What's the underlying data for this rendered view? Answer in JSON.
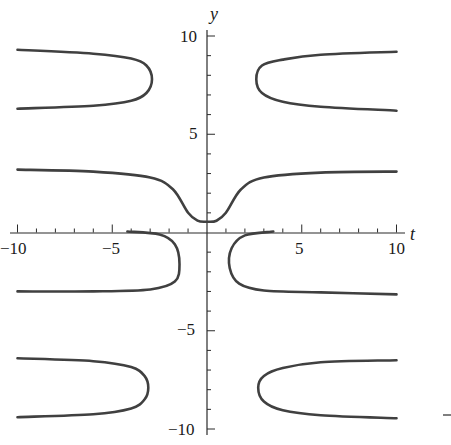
{
  "chart_data": {
    "type": "line",
    "title": "",
    "xlabel": "t",
    "ylabel": "y",
    "xlim": [
      -10,
      10
    ],
    "ylim": [
      -10,
      10
    ],
    "grid": false,
    "legend": null,
    "x_ticks_major": [
      -10,
      -5,
      5,
      10
    ],
    "x_tick_labels": [
      "−10",
      "−5",
      "5",
      "10"
    ],
    "x_ticks_minor_step": 1,
    "y_ticks_major": [
      -10,
      -5,
      5,
      10
    ],
    "y_tick_labels": [
      "−10",
      "−5",
      "5",
      "10"
    ],
    "y_ticks_minor_step": 1,
    "axes_style": "crossing at origin",
    "series": [
      {
        "name": "upper-left branch",
        "points": [
          [
            -10,
            9.3
          ],
          [
            -6,
            9.1
          ],
          [
            -4,
            8.85
          ],
          [
            -3.2,
            8.5
          ],
          [
            -2.9,
            7.8
          ],
          [
            -3.2,
            7.1
          ],
          [
            -4,
            6.7
          ],
          [
            -6,
            6.45
          ],
          [
            -10,
            6.3
          ]
        ]
      },
      {
        "name": "upper-right branch",
        "points": [
          [
            10,
            9.2
          ],
          [
            6,
            9.05
          ],
          [
            4,
            8.8
          ],
          [
            2.9,
            8.5
          ],
          [
            2.6,
            7.8
          ],
          [
            2.9,
            7.1
          ],
          [
            4,
            6.65
          ],
          [
            6,
            6.4
          ],
          [
            10,
            6.2
          ]
        ]
      },
      {
        "name": "central U branch",
        "points": [
          [
            -10,
            3.2
          ],
          [
            -6,
            3.1
          ],
          [
            -3,
            2.8
          ],
          [
            -1.8,
            2.2
          ],
          [
            -1.0,
            1.0
          ],
          [
            -0.5,
            0.6
          ],
          [
            0,
            0.55
          ],
          [
            0.5,
            0.6
          ],
          [
            1.0,
            1.0
          ],
          [
            1.8,
            2.2
          ],
          [
            3,
            2.8
          ],
          [
            6,
            3.05
          ],
          [
            10,
            3.1
          ]
        ]
      },
      {
        "name": "lower-left branch",
        "points": [
          [
            -4.2,
            0.05
          ],
          [
            -2.5,
            -0.1
          ],
          [
            -1.7,
            -0.6
          ],
          [
            -1.45,
            -1.6
          ],
          [
            -1.7,
            -2.5
          ],
          [
            -3,
            -2.9
          ],
          [
            -6,
            -3.0
          ],
          [
            -10,
            -3.0
          ]
        ]
      },
      {
        "name": "lower-right branch",
        "points": [
          [
            3.5,
            0.05
          ],
          [
            2,
            -0.15
          ],
          [
            1.3,
            -0.8
          ],
          [
            1.2,
            -1.8
          ],
          [
            1.7,
            -2.6
          ],
          [
            3,
            -2.95
          ],
          [
            6,
            -3.05
          ],
          [
            10,
            -3.15
          ]
        ]
      },
      {
        "name": "bottom-left branch",
        "points": [
          [
            -10,
            -6.4
          ],
          [
            -6,
            -6.55
          ],
          [
            -4,
            -6.85
          ],
          [
            -3.3,
            -7.3
          ],
          [
            -3.1,
            -7.9
          ],
          [
            -3.3,
            -8.5
          ],
          [
            -4,
            -8.95
          ],
          [
            -6,
            -9.25
          ],
          [
            -10,
            -9.4
          ]
        ]
      },
      {
        "name": "bottom-right branch",
        "points": [
          [
            10,
            -6.5
          ],
          [
            6,
            -6.6
          ],
          [
            4,
            -6.9
          ],
          [
            3.0,
            -7.3
          ],
          [
            2.7,
            -7.9
          ],
          [
            3.0,
            -8.6
          ],
          [
            4,
            -9.05
          ],
          [
            6,
            -9.3
          ],
          [
            10,
            -9.45
          ]
        ]
      }
    ]
  },
  "labels": {
    "x_axis": "t",
    "y_axis": "y",
    "x_neg10": "−10",
    "x_neg5": "−5",
    "x_pos5": "5",
    "x_pos10": "10",
    "y_pos10": "10",
    "y_pos5": "5",
    "y_neg5": "−5",
    "y_neg10": "−10"
  }
}
